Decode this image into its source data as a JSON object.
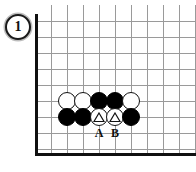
{
  "figure": {
    "number": "1"
  },
  "board": {
    "background_color": "#ffffff",
    "grid_color": "#9a9a9a",
    "edge_color": "#101010",
    "columns": 10,
    "rows": 9,
    "left_edge": true,
    "bottom_edge": true,
    "top_open": true,
    "right_open": true
  },
  "stones": [
    {
      "id": "w-c2-r5",
      "color": "white",
      "col": 2,
      "row": 5,
      "mark": ""
    },
    {
      "id": "w-c3-r5",
      "color": "white",
      "col": 3,
      "row": 5,
      "mark": ""
    },
    {
      "id": "b-c4-r5",
      "color": "black",
      "col": 4,
      "row": 5,
      "mark": ""
    },
    {
      "id": "b-c5-r5",
      "color": "black",
      "col": 5,
      "row": 5,
      "mark": ""
    },
    {
      "id": "w-c6-r5",
      "color": "white",
      "col": 6,
      "row": 5,
      "mark": ""
    },
    {
      "id": "b-c2-r6",
      "color": "black",
      "col": 2,
      "row": 6,
      "mark": ""
    },
    {
      "id": "b-c3-r6",
      "color": "black",
      "col": 3,
      "row": 6,
      "mark": ""
    },
    {
      "id": "w-c4-r6",
      "color": "white",
      "col": 4,
      "row": 6,
      "mark": "triangle"
    },
    {
      "id": "w-c5-r6",
      "color": "white",
      "col": 5,
      "row": 6,
      "mark": "triangle"
    },
    {
      "id": "b-c6-r6",
      "color": "black",
      "col": 6,
      "row": 6,
      "mark": ""
    }
  ],
  "point_labels": [
    {
      "text": "A",
      "col": 4,
      "row": 7
    },
    {
      "text": "B",
      "col": 5,
      "row": 7
    }
  ]
}
